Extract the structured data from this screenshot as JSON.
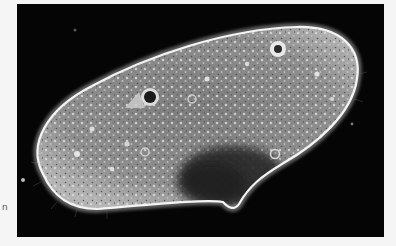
{
  "figure": {
    "imaging": "phase-contrast micrograph",
    "caption_fragment": "n",
    "colors": {
      "background": "#050505",
      "cell_outline": "#f2f2f2",
      "cytoplasm": "#8a8a8a",
      "macronucleus": "#2a2a2a",
      "page": "#f5f5f5"
    },
    "features": [
      {
        "name": "contractile-vacuole-anterior",
        "x": 133,
        "y": 93
      },
      {
        "name": "contractile-vacuole-posterior",
        "x": 261,
        "y": 45
      },
      {
        "name": "macronucleus",
        "x": 215,
        "y": 170
      },
      {
        "name": "oral-groove",
        "x": 215,
        "y": 202
      }
    ]
  }
}
